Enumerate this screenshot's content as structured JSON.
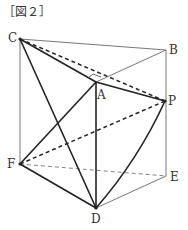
{
  "figure": {
    "caption": "［図２］"
  },
  "points": {
    "C": {
      "label": "C",
      "x": 20,
      "y": 39
    },
    "B": {
      "label": "B",
      "x": 166,
      "y": 50
    },
    "A": {
      "label": "A",
      "x": 96,
      "y": 82
    },
    "P": {
      "label": "P",
      "x": 165,
      "y": 101
    },
    "F": {
      "label": "F",
      "x": 20,
      "y": 164
    },
    "E": {
      "label": "E",
      "x": 166,
      "y": 176
    },
    "D": {
      "label": "D",
      "x": 96,
      "y": 208
    }
  },
  "edges": {
    "thin_solid": [
      [
        "C",
        "B"
      ],
      [
        "B",
        "E"
      ],
      [
        "C",
        "F"
      ],
      [
        "D",
        "E"
      ],
      [
        "A",
        "B"
      ]
    ],
    "thin_dashed": [
      [
        "F",
        "E"
      ]
    ],
    "thick_solid": [
      [
        "C",
        "A"
      ],
      [
        "A",
        "P"
      ],
      [
        "A",
        "D"
      ],
      [
        "C",
        "D"
      ],
      [
        "A",
        "F"
      ],
      [
        "F",
        "D"
      ],
      [
        "P",
        "D"
      ]
    ],
    "thick_dashed": [
      [
        "C",
        "P"
      ],
      [
        "F",
        "P"
      ]
    ]
  },
  "annotations": {
    "right_angle_mark_at": "A"
  }
}
